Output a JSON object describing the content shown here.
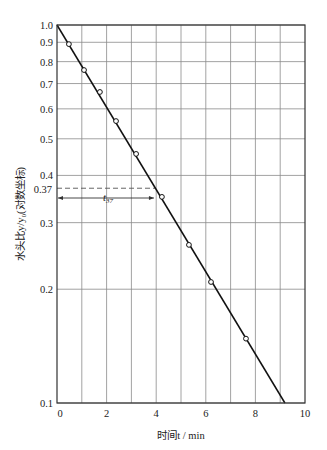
{
  "chart_data": {
    "type": "scatter",
    "title": "",
    "xlabel": "时间t / min",
    "ylabel": "水头比y/y₀(对数坐标)",
    "xlim": [
      0,
      10
    ],
    "ylim": [
      0.1,
      1.0
    ],
    "yscale": "log",
    "grid": true,
    "x_ticks": [
      0,
      2,
      4,
      6,
      8,
      10
    ],
    "x_gridlines": [
      1,
      2,
      3,
      4,
      5,
      6,
      7,
      8,
      9
    ],
    "y_ticks": [
      1.0,
      0.9,
      0.8,
      0.7,
      0.6,
      0.5,
      0.4,
      0.3,
      0.2,
      0.1
    ],
    "y_tick_labels": [
      "1.0",
      "0.9",
      "0.8",
      "0.7",
      "0.6",
      "0.5",
      "0.4",
      "0.3",
      "0.2",
      "0.1"
    ],
    "series": [
      {
        "name": "measured",
        "marker": "open-circle",
        "x": [
          0.48,
          1.09,
          1.73,
          2.38,
          3.19,
          4.23,
          5.32,
          6.21,
          7.62
        ],
        "y": [
          0.89,
          0.76,
          0.665,
          0.557,
          0.456,
          0.351,
          0.262,
          0.209,
          0.148
        ]
      },
      {
        "name": "fitted-line",
        "style": "line",
        "x": [
          0,
          9.19
        ],
        "y": [
          1.0,
          0.1
        ]
      }
    ],
    "annotations": [
      {
        "type": "dashed-hline",
        "y": 0.37,
        "x_from": 0,
        "x_to": 3.95,
        "label": "0.37"
      },
      {
        "type": "double-arrow",
        "y": 0.355,
        "x_from": 0,
        "x_to": 3.95,
        "label": "t",
        "label_sub": "37"
      }
    ]
  },
  "labels": {
    "xlabel": "时间t / min",
    "ylabel": "水头比y/y₀(对数坐标)",
    "t37_main": "t",
    "t37_sub": "37",
    "annot_037": "0.37"
  }
}
